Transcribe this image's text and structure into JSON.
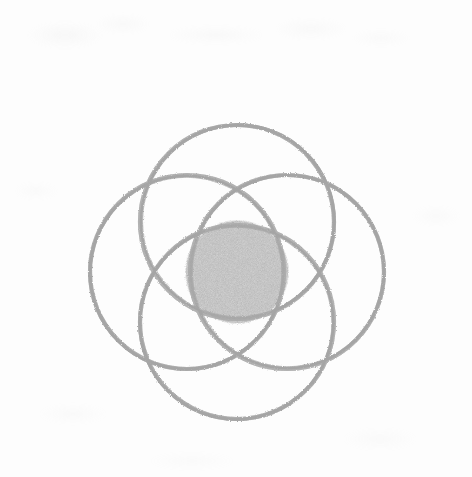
{
  "canvas": {
    "width": 472,
    "height": 477,
    "background_color": "#fdfdfd",
    "medium": "graphite pencil on white paper",
    "title": "Four overlapping circles rosette with shaded center"
  },
  "style": {
    "stroke_color": "#b2b2b2",
    "stroke_color_dark": "#9c9c9c",
    "stroke_width": 4.2,
    "fill_color": "#b8b8b8",
    "fill_color_dark": "#a6a6a6",
    "texture": "grainy-pencil"
  },
  "chart_data": {
    "type": "scatter",
    "xlabel": "",
    "ylabel": "",
    "xlim": [
      0,
      472
    ],
    "ylim": [
      0,
      477
    ],
    "grid": false,
    "legend": "none",
    "center": {
      "x": 237,
      "y": 272
    },
    "shapes": [
      {
        "name": "circle-top",
        "type": "circle",
        "cx": 237,
        "cy": 222,
        "r": 97,
        "fill": "none",
        "stroke": "#b2b2b2",
        "stroke_width": 4.2
      },
      {
        "name": "circle-bottom",
        "type": "circle",
        "cx": 237,
        "cy": 322,
        "r": 97,
        "fill": "none",
        "stroke": "#b2b2b2",
        "stroke_width": 4.2
      },
      {
        "name": "circle-left",
        "type": "circle",
        "cx": 187,
        "cy": 272,
        "r": 97,
        "fill": "none",
        "stroke": "#b2b2b2",
        "stroke_width": 4.2
      },
      {
        "name": "circle-right",
        "type": "circle",
        "cx": 287,
        "cy": 272,
        "r": 97,
        "fill": "none",
        "stroke": "#b2b2b2",
        "stroke_width": 4.2
      },
      {
        "name": "circle-center-filled",
        "type": "circle",
        "cx": 237,
        "cy": 272,
        "r": 52,
        "fill": "#b8b8b8",
        "stroke": "none",
        "stroke_width": 0
      }
    ],
    "extents": {
      "leftmost_x": 90,
      "rightmost_x": 384,
      "topmost_y": 125,
      "bottommost_y": 419
    },
    "counts": {
      "outline_circles": 4,
      "filled_circles": 1,
      "total_circles": 5
    }
  },
  "smudges": [
    {
      "name": "smudge-top-left-a",
      "x": 28,
      "y": 22,
      "w": 74,
      "h": 26,
      "opacity": 0.3
    },
    {
      "name": "smudge-top-left-b",
      "x": 96,
      "y": 14,
      "w": 54,
      "h": 20,
      "opacity": 0.22
    },
    {
      "name": "smudge-top-mid",
      "x": 168,
      "y": 26,
      "w": 96,
      "h": 18,
      "opacity": 0.26
    },
    {
      "name": "smudge-top-right-a",
      "x": 276,
      "y": 18,
      "w": 70,
      "h": 22,
      "opacity": 0.24
    },
    {
      "name": "smudge-top-right-b",
      "x": 352,
      "y": 30,
      "w": 58,
      "h": 16,
      "opacity": 0.2
    },
    {
      "name": "smudge-left-mid",
      "x": 14,
      "y": 182,
      "w": 44,
      "h": 18,
      "opacity": 0.18
    },
    {
      "name": "smudge-right-mid",
      "x": 412,
      "y": 206,
      "w": 48,
      "h": 20,
      "opacity": 0.18
    },
    {
      "name": "smudge-bottom-left",
      "x": 40,
      "y": 404,
      "w": 66,
      "h": 20,
      "opacity": 0.2
    },
    {
      "name": "smudge-bottom-right",
      "x": 344,
      "y": 428,
      "w": 72,
      "h": 22,
      "opacity": 0.2
    },
    {
      "name": "smudge-bottom-mid",
      "x": 150,
      "y": 452,
      "w": 84,
      "h": 18,
      "opacity": 0.16
    }
  ]
}
